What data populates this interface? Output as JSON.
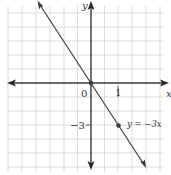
{
  "chart_data": {
    "type": "line",
    "title": "",
    "xlabel": "x",
    "ylabel": "y",
    "series": [
      {
        "name": "y = −3x",
        "equation": "y = -3x",
        "slope": -3,
        "intercept": 0,
        "points": [
          {
            "x": 0,
            "y": 0
          },
          {
            "x": 1,
            "y": -3
          }
        ]
      }
    ],
    "x_ticks_labeled": [
      {
        "value": 0,
        "label": "0"
      },
      {
        "value": 1,
        "label": "1"
      }
    ],
    "y_ticks_labeled": [
      {
        "value": -3,
        "label": "−3"
      }
    ],
    "xlim": [
      -3.05,
      2.8
    ],
    "ylim": [
      -6,
      6
    ],
    "grid": true,
    "legend": "inline annotation next to point (1, −3)"
  },
  "labels": {
    "x_axis": "x",
    "y_axis": "y",
    "origin": "0",
    "x_tick_1": "1",
    "y_tick_neg3": "−3",
    "line_label": "y = −3x"
  },
  "colors": {
    "grid": "#d4d4d4",
    "axis": "#3a3a3a",
    "line": "#4a4a4a",
    "point": "#3a3a3a",
    "text": "#333333"
  }
}
